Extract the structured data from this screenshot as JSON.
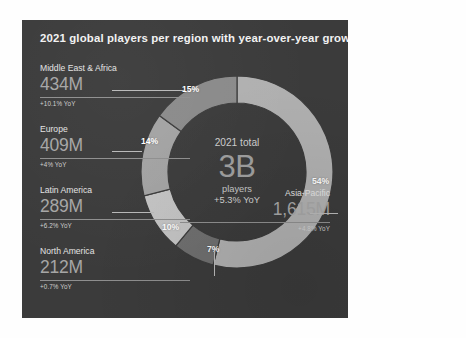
{
  "panel": {
    "title": "2021 global players per region with year-over-year growth rates",
    "background_color": "#3b3b3b"
  },
  "center": {
    "top_label": "2021 total",
    "value": "3B",
    "unit": "players",
    "growth": "+5.3% YoY"
  },
  "regions": [
    {
      "name": "Middle East & Africa",
      "value": "434M",
      "growth": "+10.1% YoY",
      "percent_label": "15%",
      "color": "#8a8a8a"
    },
    {
      "name": "Europe",
      "value": "409M",
      "growth": "+4% YoY",
      "percent_label": "14%",
      "color": "#a3a3a3"
    },
    {
      "name": "Latin America",
      "value": "289M",
      "growth": "+6.2% YoY",
      "percent_label": "10%",
      "color": "#c4c4c4"
    },
    {
      "name": "North America",
      "value": "212M",
      "growth": "+0.7% YoY",
      "percent_label": "7%",
      "color": "#6f6f6f"
    },
    {
      "name": "Asia-Pacific",
      "value": "1,615M",
      "growth": "+4.8% YoY",
      "percent_label": "54%",
      "color": "#b0b0b0"
    }
  ],
  "chart_data": {
    "type": "pie",
    "title": "2021 global players per region with year-over-year growth rates",
    "subtype": "donut",
    "categories": [
      "Asia-Pacific",
      "North America",
      "Latin America",
      "Europe",
      "Middle East & Africa"
    ],
    "values": [
      54,
      7,
      10,
      14,
      15
    ],
    "value_unit": "percent of global players",
    "absolute_values": [
      1615,
      212,
      289,
      409,
      434
    ],
    "absolute_unit": "millions of players",
    "data_labels": [
      "54%",
      "7%",
      "10%",
      "14%",
      "15%"
    ],
    "growth_rates": [
      "+4.8% YoY",
      "+0.7% YoY",
      "+6.2% YoY",
      "+4% YoY",
      "+10.1% YoY"
    ],
    "center_total": "3B",
    "center_total_label": "2021 total",
    "center_unit": "players",
    "center_growth": "+5.3% YoY",
    "start_angle_deg": 0,
    "direction": "clockwise",
    "legend": "direct labels with leader lines",
    "grid": false,
    "colors": [
      "#b0b0b0",
      "#6f6f6f",
      "#c4c4c4",
      "#a3a3a3",
      "#8a8a8a"
    ]
  }
}
